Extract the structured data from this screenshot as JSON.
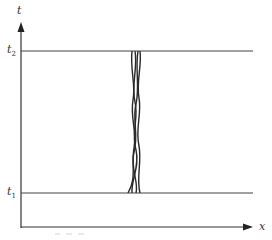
{
  "diagram": {
    "axes": {
      "vertical_label": "t",
      "horizontal_label": "x"
    },
    "levels": [
      {
        "name": "t2",
        "label_base": "t",
        "label_sub": "2",
        "y": 51
      },
      {
        "name": "t1",
        "label_base": "t",
        "label_sub": "1",
        "y": 193
      }
    ],
    "worldsheet": {
      "description": "bundle of intertwined wavy strands between t1 and t2",
      "strand_count": 4
    },
    "caption_fragment": "3.17",
    "colors": {
      "line": "#333333",
      "strands": "#2a2a2a",
      "background": "#ffffff"
    }
  }
}
